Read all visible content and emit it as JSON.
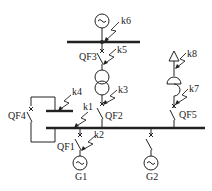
{
  "diagram": {
    "type": "power-system single-line diagram",
    "colors": {
      "line": "#222222",
      "background": "#ffffff"
    },
    "buses": [
      {
        "id": "top-bus",
        "label": ""
      },
      {
        "id": "mid-bus",
        "label": ""
      },
      {
        "id": "main-bus",
        "label": ""
      }
    ],
    "generators": [
      {
        "id": "gen-top",
        "label": "",
        "symbol": "~"
      },
      {
        "id": "G1",
        "label": "G1",
        "symbol": "~"
      },
      {
        "id": "G2",
        "label": "G2",
        "symbol": "~"
      }
    ],
    "breakers": [
      {
        "id": "QF1",
        "label": "QF1"
      },
      {
        "id": "QF2",
        "label": "QF2"
      },
      {
        "id": "QF3",
        "label": "QF3"
      },
      {
        "id": "QF4",
        "label": "QF4"
      },
      {
        "id": "QF5",
        "label": "QF5"
      }
    ],
    "fault_points": [
      {
        "id": "k1",
        "label": "k1"
      },
      {
        "id": "k2",
        "label": "k2"
      },
      {
        "id": "k3",
        "label": "k3"
      },
      {
        "id": "k4",
        "label": "k4"
      },
      {
        "id": "k5",
        "label": "k5"
      },
      {
        "id": "k6",
        "label": "k6"
      },
      {
        "id": "k7",
        "label": "k7"
      },
      {
        "id": "k8",
        "label": "k8"
      }
    ],
    "transformer": {
      "id": "T",
      "label": ""
    },
    "reactor": {
      "id": "L",
      "label": ""
    },
    "load": {
      "id": "load",
      "label": ""
    }
  }
}
